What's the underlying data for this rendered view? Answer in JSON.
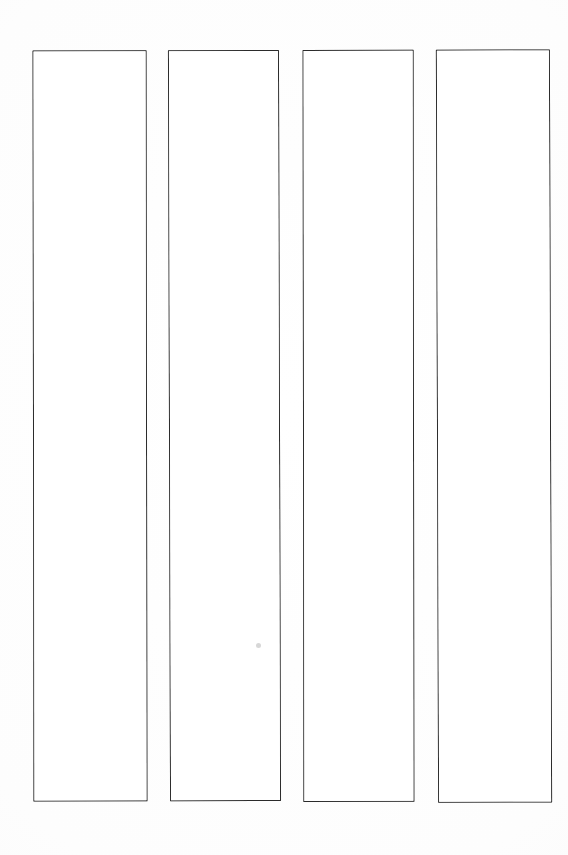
{
  "document": {
    "type": "scanned-blank-form",
    "orientation": "portrait",
    "page_width": 568,
    "page_height": 855,
    "background_color": "#ffffff",
    "ink_color": "#2b2b2b",
    "title": "",
    "visible_text": "",
    "notes": "No printed text, headings, numbers or labels are visible anywhere on the page."
  },
  "columns": {
    "count": 4,
    "label": "",
    "items": [
      {
        "name": "column-1",
        "label": "",
        "content": "",
        "x": 33,
        "y": 50,
        "width": 114,
        "height": 751
      },
      {
        "name": "column-2",
        "label": "",
        "content": "",
        "x": 169,
        "y": 50,
        "width": 111,
        "height": 751
      },
      {
        "name": "column-3",
        "label": "",
        "content": "",
        "x": 303,
        "y": 50,
        "width": 111,
        "height": 752
      },
      {
        "name": "column-4",
        "label": "",
        "content": "",
        "x": 437,
        "y": 50,
        "width": 114,
        "height": 753
      }
    ]
  },
  "artifacts": {
    "speck": {
      "label": "",
      "x": 256,
      "y": 643,
      "color": "#969696"
    }
  }
}
